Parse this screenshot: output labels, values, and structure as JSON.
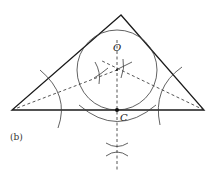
{
  "figure": {
    "caption": "(b)",
    "labels": {
      "center": "O",
      "tangent_point": "C"
    },
    "colors": {
      "ink": "#1a1a1a",
      "background": "#ffffff"
    },
    "triangle": {
      "vertices": [
        [
          121,
          15
        ],
        [
          12,
          110
        ],
        [
          204,
          110
        ]
      ]
    },
    "incircle": {
      "center": [
        117,
        70
      ],
      "radius": 40
    },
    "tangent_point": [
      117,
      110
    ]
  }
}
